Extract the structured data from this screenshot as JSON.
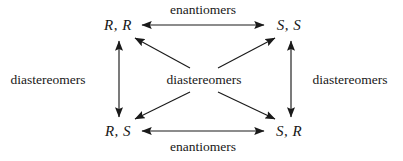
{
  "diagram": {
    "type": "relationship-graph",
    "nodes": [
      {
        "id": "rr",
        "label": "R, R",
        "position": "top-left",
        "x": 118,
        "y": 25
      },
      {
        "id": "ss",
        "label": "S, S",
        "position": "top-right",
        "x": 289,
        "y": 25
      },
      {
        "id": "rs",
        "label": "R, S",
        "position": "bottom-left",
        "x": 118,
        "y": 131
      },
      {
        "id": "sr",
        "label": "S, R",
        "position": "bottom-right",
        "x": 289,
        "y": 131
      }
    ],
    "edges": [
      {
        "id": "top-horizontal",
        "from": "rr",
        "to": "ss",
        "relationship": "enantiomers",
        "arrow": "double"
      },
      {
        "id": "bottom-horizontal",
        "from": "rs",
        "to": "sr",
        "relationship": "enantiomers",
        "arrow": "double"
      },
      {
        "id": "left-vertical",
        "from": "rr",
        "to": "rs",
        "relationship": "diastereomers",
        "arrow": "double"
      },
      {
        "id": "right-vertical",
        "from": "ss",
        "to": "sr",
        "relationship": "diastereomers",
        "arrow": "double"
      },
      {
        "id": "diagonal-rr",
        "from": "center",
        "to": "rr",
        "relationship": "diastereomers",
        "arrow": "single"
      },
      {
        "id": "diagonal-ss",
        "from": "center",
        "to": "ss",
        "relationship": "diastereomers",
        "arrow": "single"
      },
      {
        "id": "diagonal-rs",
        "from": "center",
        "to": "rs",
        "relationship": "diastereomers",
        "arrow": "single"
      },
      {
        "id": "diagonal-sr",
        "from": "center",
        "to": "sr",
        "relationship": "diastereomers",
        "arrow": "single"
      }
    ],
    "labels": {
      "top_enantiomers": "enantiomers",
      "bottom_enantiomers": "enantiomers",
      "left_diastereomers": "diastereomers",
      "right_diastereomers": "diastereomers",
      "center_diastereomers": "diastereomers"
    },
    "colors": {
      "background": "#ffffff",
      "ink": "#1a1a1a"
    }
  }
}
